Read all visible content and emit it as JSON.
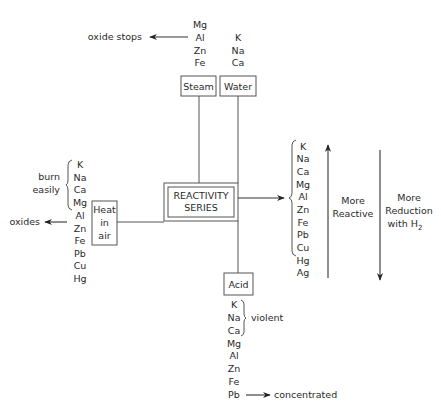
{
  "center": {
    "line1": "REACTIVITY",
    "line2": "SERIES"
  },
  "steam": {
    "label": "Steam",
    "metals": [
      "Mg",
      "Al",
      "Zn",
      "Fe"
    ],
    "note": "oxide stops"
  },
  "water": {
    "label": "Water",
    "metals": [
      "K",
      "Na",
      "Ca"
    ]
  },
  "heat_in_air": {
    "label_lines": [
      "Heat",
      "in",
      "air"
    ],
    "metals": [
      "K",
      "Na",
      "Ca",
      "Mg",
      "Al",
      "Zn",
      "Fe",
      "Pb",
      "Cu",
      "Hg"
    ],
    "brace_note_lines": [
      "burn",
      "easily"
    ],
    "arrow_note": "oxides"
  },
  "acid": {
    "label": "Acid",
    "metals": [
      "K",
      "Na",
      "Ca",
      "Mg",
      "Al",
      "Zn",
      "Fe",
      "Pb"
    ],
    "brace_note": "violent",
    "arrow_note": "concentrated"
  },
  "series": {
    "metals": [
      "K",
      "Na",
      "Ca",
      "Mg",
      "Al",
      "Zn",
      "Fe",
      "Pb",
      "Cu",
      "Hg",
      "Ag"
    ],
    "up_arrow_label_lines": [
      "More",
      "Reactive"
    ],
    "down_arrow_label_lines": [
      "More",
      "Reduction",
      "with H"
    ],
    "down_arrow_subscript": "2"
  }
}
